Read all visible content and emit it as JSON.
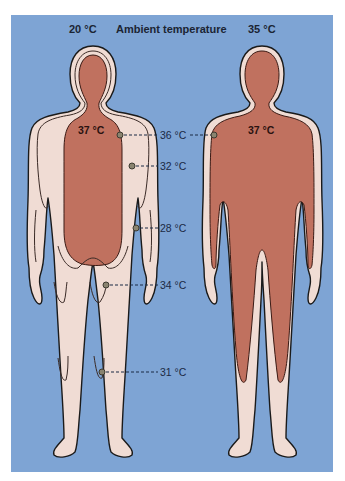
{
  "header": {
    "left_temp": "20 °C",
    "title": "Ambient temperature",
    "right_temp": "35 °C"
  },
  "left_figure": {
    "ambient": "20 °C",
    "core_label": "37 °C",
    "measurements": [
      {
        "label": "36 °C",
        "site": "upper arm"
      },
      {
        "label": "32 °C",
        "site": "elbow"
      },
      {
        "label": "28 °C",
        "site": "hand/wrist"
      },
      {
        "label": "34 °C",
        "site": "thigh"
      },
      {
        "label": "31 °C",
        "site": "knee/lower leg"
      }
    ]
  },
  "right_figure": {
    "ambient": "35 °C",
    "core_label": "37 °C"
  },
  "colors": {
    "background": "#7ea4d4",
    "core": "#c0715f",
    "shell": "#f0dcd4",
    "outline": "#1a1a1a",
    "leader": "#1b2a44",
    "probe": "#8a8470"
  }
}
